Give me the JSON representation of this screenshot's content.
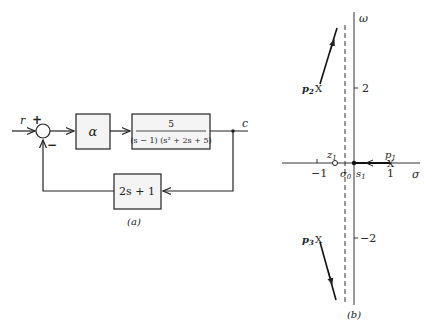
{
  "figure_a": {
    "caption": "(a)",
    "input_label": "r",
    "output_label": "c",
    "sum_plus": "+",
    "sum_minus": "−",
    "gain_block": "α",
    "plant_numerator": "5",
    "plant_denominator": "(s − 1) (s² + 2s + 5)",
    "feedback_block": "2s + 1"
  },
  "figure_b": {
    "caption": "(b)",
    "axis_vertical_label": "ω",
    "axis_horizontal_label": "σ",
    "tick_pos2": "2",
    "tick_neg2": "−2",
    "tick_neg1": "−1",
    "tick_pos1": "1",
    "pole1": "p",
    "pole1_sub": "1",
    "pole2": "p",
    "pole2_sub": "2",
    "pole3": "p",
    "pole3_sub": "3",
    "zero1": "z",
    "zero1_sub": "1",
    "sigma0": "σ",
    "sigma0_sub": "0",
    "s1": "s",
    "s1_sub": "1"
  }
}
